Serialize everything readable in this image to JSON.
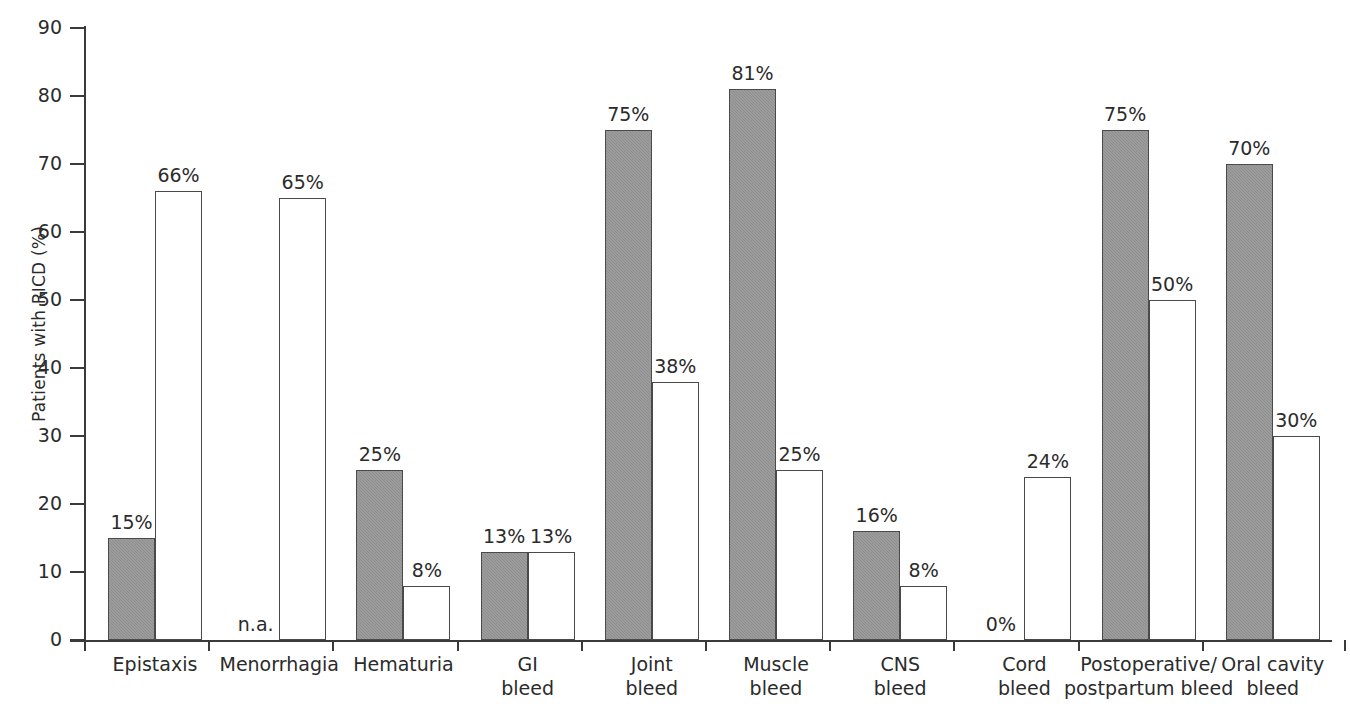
{
  "chart_data": {
    "type": "bar",
    "title": "",
    "xlabel": "",
    "ylabel": "Patients with RICD (%)",
    "ylim": [
      0,
      90
    ],
    "ytick_labels": [
      "0",
      "10",
      "20",
      "30",
      "40",
      "50",
      "60",
      "70",
      "80",
      "90"
    ],
    "ytick_values": [
      0,
      10,
      20,
      30,
      40,
      50,
      60,
      70,
      80,
      90
    ],
    "grid": false,
    "legend_position": "none",
    "categories": [
      "Epistaxis",
      "Menorrhagia",
      "Hematuria",
      "GI\nbleed",
      "Joint\nbleed",
      "Muscle\nbleed",
      "CNS\nbleed",
      "Cord\nbleed",
      "Postoperative/\npostpartum bleed",
      "Oral cavity\nbleed"
    ],
    "series": [
      {
        "name": "filled",
        "style": "gray-filled",
        "values": [
          15,
          null,
          25,
          13,
          75,
          81,
          16,
          0,
          75,
          70
        ],
        "labels": [
          "15%",
          "n.a.",
          "25%",
          "13%",
          "75%",
          "81%",
          "16%",
          "0%",
          "75%",
          "70%"
        ]
      },
      {
        "name": "open",
        "style": "white-outlined",
        "values": [
          66,
          65,
          8,
          13,
          38,
          25,
          8,
          24,
          50,
          30
        ],
        "labels": [
          "66%",
          "65%",
          "8%",
          "13%",
          "38%",
          "25%",
          "8%",
          "24%",
          "50%",
          "30%"
        ]
      }
    ],
    "colors": {
      "filled_bar": "#8d8d8d",
      "open_bar": "#ffffff",
      "bar_outline": "#4a4a4a",
      "axis": "#3a3a3a",
      "text": "#2b2b2b"
    }
  }
}
